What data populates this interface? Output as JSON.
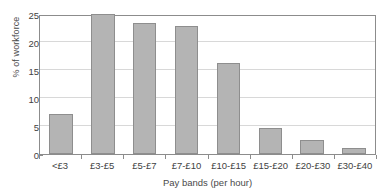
{
  "figure": {
    "caption_remnant": "",
    "background_color": "#ffffff"
  },
  "style": {
    "bar_fill": "#b4b4b4",
    "bar_border": "#8e8e8e",
    "axis_color": "#8c8c8c",
    "grid_color": "#d8d8d8",
    "text_color": "#3f3f3f"
  },
  "chart_data": {
    "type": "bar",
    "title": "",
    "xlabel": "Pay bands (per hour)",
    "ylabel": "% of workforce",
    "categories": [
      "<£3",
      "£3-£5",
      "£5-£7",
      "£7-£10",
      "£10-£15",
      "£15-£20",
      "£20-£30",
      "£30-£40"
    ],
    "values": [
      7.1,
      25.0,
      23.4,
      22.8,
      16.3,
      4.7,
      2.5,
      1.0
    ],
    "ylim": [
      0,
      25
    ],
    "yticks": [
      0,
      5,
      10,
      15,
      20,
      25
    ],
    "ytick_labels": [
      "0",
      "5",
      "10",
      "15",
      "20",
      "25"
    ],
    "grid": true,
    "grid_axis": "y",
    "legend": false,
    "legend_position": "none"
  }
}
